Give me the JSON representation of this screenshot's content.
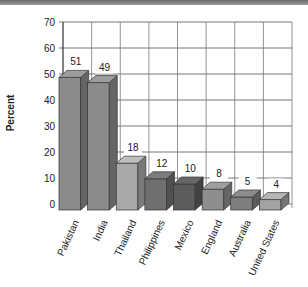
{
  "chart_data": {
    "type": "bar",
    "style": "3d",
    "title": "",
    "xlabel": "",
    "ylabel": "Percent",
    "ylim": [
      0,
      70
    ],
    "yticks": [
      0,
      10,
      20,
      30,
      40,
      50,
      60,
      70
    ],
    "grid": true,
    "legend": null,
    "categories": [
      "Pakistan",
      "India",
      "Thailand",
      "Philippines",
      "Mexico",
      "England",
      "Australia",
      "United States"
    ],
    "values": [
      51,
      49,
      18,
      12,
      10,
      8,
      5,
      4
    ],
    "value_labels": [
      "51",
      "49",
      "18",
      "12",
      "10",
      "8",
      "5",
      "4"
    ],
    "bar_colors": [
      "#8c8c8c",
      "#8c8c8c",
      "#a9a9a9",
      "#6f6f6f",
      "#5c5c5c",
      "#8e8e8e",
      "#7e7e7e",
      "#a2a2a2"
    ]
  }
}
